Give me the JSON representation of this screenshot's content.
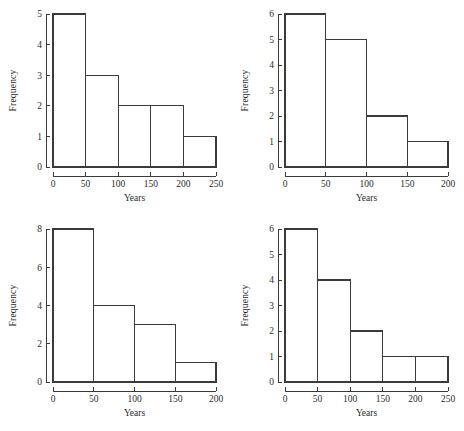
{
  "figure": {
    "background": "#ffffff",
    "line_color": "#3b3b3b",
    "text_color": "#2b2b2b",
    "panel_count": 4,
    "layout": "2x2-grid"
  },
  "chart_data": [
    {
      "id": "top-left",
      "type": "bar",
      "title": "",
      "xlabel": "Years",
      "ylabel": "Frequency",
      "bin_width": 50,
      "bin_edges": [
        0,
        50,
        100,
        150,
        200,
        250
      ],
      "categories": [
        "0-50",
        "50-100",
        "100-150",
        "150-200",
        "200-250"
      ],
      "values": [
        5,
        3,
        2,
        2,
        1
      ],
      "xlim": [
        0,
        250
      ],
      "ylim": [
        0,
        5
      ],
      "xticks": [
        0,
        50,
        100,
        150,
        200,
        250
      ],
      "yticks": [
        0,
        1,
        2,
        3,
        4,
        5
      ],
      "xtick_labels": [
        "0",
        "50",
        "100",
        "150",
        "200",
        "250"
      ],
      "ytick_labels": [
        "0",
        "1",
        "2",
        "3",
        "4",
        "5"
      ],
      "grid": false,
      "legend": false
    },
    {
      "id": "top-right",
      "type": "bar",
      "title": "",
      "xlabel": "Years",
      "ylabel": "Frequency",
      "bin_width": 50,
      "bin_edges": [
        0,
        50,
        100,
        150,
        200
      ],
      "categories": [
        "0-50",
        "50-100",
        "100-150",
        "150-200"
      ],
      "values": [
        6,
        5,
        2,
        1
      ],
      "xlim": [
        0,
        200
      ],
      "ylim": [
        0,
        6
      ],
      "xticks": [
        0,
        50,
        100,
        150,
        200
      ],
      "yticks": [
        0,
        1,
        2,
        3,
        4,
        5,
        6
      ],
      "xtick_labels": [
        "0",
        "50",
        "100",
        "150",
        "200"
      ],
      "ytick_labels": [
        "0",
        "1",
        "2",
        "3",
        "4",
        "5",
        "6"
      ],
      "grid": false,
      "legend": false
    },
    {
      "id": "bottom-left",
      "type": "bar",
      "title": "",
      "xlabel": "Years",
      "ylabel": "Frequency",
      "bin_width": 50,
      "bin_edges": [
        0,
        50,
        100,
        150,
        200
      ],
      "categories": [
        "0-50",
        "50-100",
        "100-150",
        "150-200"
      ],
      "values": [
        8,
        4,
        3,
        1
      ],
      "xlim": [
        0,
        200
      ],
      "ylim": [
        0,
        8
      ],
      "xticks": [
        0,
        50,
        100,
        150,
        200
      ],
      "yticks": [
        0,
        2,
        4,
        6,
        8
      ],
      "xtick_labels": [
        "0",
        "50",
        "100",
        "150",
        "200"
      ],
      "ytick_labels": [
        "0",
        "2",
        "4",
        "6",
        "8"
      ],
      "grid": false,
      "legend": false
    },
    {
      "id": "bottom-right",
      "type": "bar",
      "title": "",
      "xlabel": "Years",
      "ylabel": "Frequency",
      "bin_width": 50,
      "bin_edges": [
        0,
        50,
        100,
        150,
        200,
        250
      ],
      "categories": [
        "0-50",
        "50-100",
        "100-150",
        "150-200",
        "200-250"
      ],
      "values": [
        6,
        4,
        2,
        1,
        1
      ],
      "xlim": [
        0,
        250
      ],
      "ylim": [
        0,
        6
      ],
      "xticks": [
        0,
        50,
        100,
        150,
        200,
        250
      ],
      "yticks": [
        0,
        1,
        2,
        3,
        4,
        5,
        6
      ],
      "xtick_labels": [
        "0",
        "50",
        "100",
        "150",
        "200",
        "250"
      ],
      "ytick_labels": [
        "0",
        "1",
        "2",
        "3",
        "4",
        "5",
        "6"
      ],
      "grid": false,
      "legend": false
    }
  ]
}
